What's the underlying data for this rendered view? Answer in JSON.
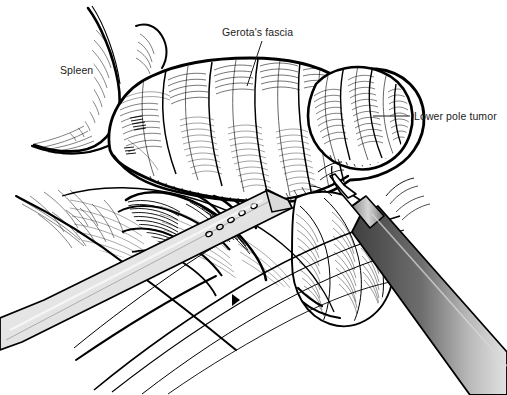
{
  "figure": {
    "domain": "medical-surgical-illustration",
    "background_color": "#ffffff",
    "width": 507,
    "height": 395,
    "style": "black-and-white pen-and-ink line drawing with cross-hatching"
  },
  "annotations": [
    {
      "id": "spleen",
      "label": "Spleen",
      "x": 60,
      "y": 64,
      "has_leader_line": false
    },
    {
      "id": "gerotas_fascia",
      "label": "Gerota's fascia",
      "x": 222,
      "y": 26,
      "has_leader_line": true,
      "leader": {
        "x1": 262,
        "y1": 41,
        "x2": 247,
        "y2": 86
      }
    },
    {
      "id": "lower_pole_tumor",
      "label": "Lower pole tumor",
      "x": 414,
      "y": 110,
      "has_leader_line": true,
      "leader": {
        "x1": 373,
        "y1": 116,
        "x2": 410,
        "y2": 116
      }
    }
  ],
  "structures": [
    {
      "name": "spleen",
      "description": "curved organ edge at upper left with fine hatching"
    },
    {
      "name": "kidney-gerotas-fascia",
      "description": "large lobulated fat-covered kidney mass occupying center"
    },
    {
      "name": "lower-pole-tumor",
      "description": "rounded lobulated tumor bulge at right lower pole"
    },
    {
      "name": "perirenal-fat-planes",
      "description": "hatched tissue planes below and left of kidney"
    },
    {
      "name": "renal-hilum-vessels",
      "description": "densely hatched vascular bundle under kidney"
    }
  ],
  "instruments": [
    {
      "id": "fan-retractor",
      "name": "Fenestrated retractor blade",
      "shading": "light gray",
      "fill_color": "#e6e6e6",
      "fenestration_count": 5,
      "angle_description": "enters from lower left, tip at upper right under kidney"
    },
    {
      "id": "laparoscopic-dissector",
      "name": "Laparoscopic dissector / grasper",
      "shading": "dark gray gradient shaft with light collar",
      "shaft_dark_color": "#4a4a4a",
      "shaft_light_color": "#c9c9c9",
      "collar_color": "#9a9a9a",
      "angle_description": "enters from lower right, tip engaging tissue beside tumor"
    }
  ],
  "colors": {
    "ink": "#000000",
    "text": "#1b1b1b",
    "paper": "#ffffff",
    "retractor_fill": "#e6e6e6",
    "instrument_dark": "#4a4a4a",
    "instrument_mid": "#7d7d7d",
    "instrument_light": "#d0d0d0"
  }
}
